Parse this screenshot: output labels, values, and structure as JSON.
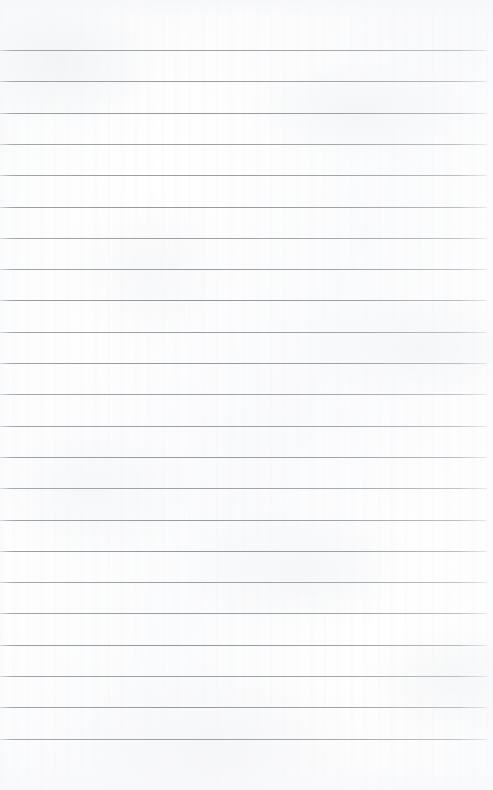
{
  "page": {
    "document_type": "ruled-notebook-page",
    "content_text": "",
    "width_px": 493,
    "height_px": 790,
    "background_color": "#fdfdfd",
    "paper_tint": "#ffffff"
  },
  "ruling": {
    "line_color": "#8e949c",
    "line_thickness_px": 1,
    "line_spacing_px": 31.3,
    "first_line_y_px": 50,
    "line_left_x_px": 0,
    "line_right_x_px": 487,
    "line_count": 23,
    "line_y_positions": [
      50,
      81.3,
      112.6,
      143.9,
      175.2,
      206.5,
      237.8,
      269.1,
      300.4,
      331.7,
      363,
      394.3,
      425.6,
      456.9,
      488.2,
      519.5,
      550.8,
      582.1,
      613.4,
      644.7,
      676,
      707.3,
      738.6
    ]
  },
  "margins": {
    "top_margin_px": 50,
    "bottom_margin_px": 51,
    "right_margin_px": 6,
    "left_margin_px": 0
  }
}
